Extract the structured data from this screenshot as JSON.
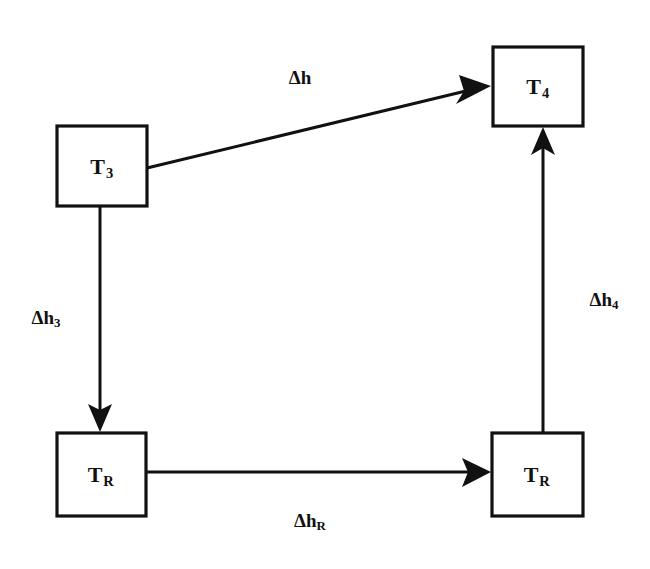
{
  "diagram": {
    "type": "block-flow-diagram",
    "title": "",
    "background_color": "#ffffff",
    "line_color": "#111111",
    "nodes": [
      {
        "id": "T3",
        "base": "T",
        "subscript": "3",
        "label": "T3",
        "x": 57,
        "y": 126,
        "width": 90,
        "height": 80,
        "center_x": 102,
        "center_y": 166
      },
      {
        "id": "T4",
        "base": "T",
        "subscript": "4",
        "label": "T4",
        "x": 493,
        "y": 47,
        "width": 90,
        "height": 79,
        "center_x": 538,
        "center_y": 86
      },
      {
        "id": "TR_left",
        "base": "T",
        "subscript": "R",
        "label": "TR",
        "x": 57,
        "y": 433,
        "width": 89,
        "height": 83,
        "center_x": 101,
        "center_y": 474
      },
      {
        "id": "TR_right",
        "base": "T",
        "subscript": "R",
        "label": "TR",
        "x": 492,
        "y": 433,
        "width": 91,
        "height": 83,
        "center_x": 537,
        "center_y": 474
      }
    ],
    "edges": [
      {
        "id": "edge-dh",
        "from": "T3",
        "to": "T4",
        "direction": "diagonal-up-right",
        "label_base": "Δh",
        "label_subscript": "",
        "label": "Δh",
        "label_x": 300,
        "label_y": 78,
        "x1": 147,
        "y1": 168,
        "x2": 489,
        "y2": 86
      },
      {
        "id": "edge-dh3",
        "from": "T3",
        "to": "TR_left",
        "direction": "down",
        "label_base": "Δh",
        "label_subscript": "3",
        "label": "Δh3",
        "label_x": 46,
        "label_y": 318,
        "x1": 100,
        "y1": 206,
        "x2": 100,
        "y2": 430
      },
      {
        "id": "edge-dhR",
        "from": "TR_left",
        "to": "TR_right",
        "direction": "right",
        "label_base": "Δh",
        "label_subscript": "R",
        "label": "ΔhR",
        "label_x": 310,
        "label_y": 521,
        "x1": 146,
        "y1": 472,
        "x2": 489,
        "y2": 472
      },
      {
        "id": "edge-dh4",
        "from": "TR_right",
        "to": "T4",
        "direction": "up",
        "label_base": "Δh",
        "label_subscript": "4",
        "label": "Δh4",
        "label_x": 604,
        "label_y": 300,
        "x1": 543,
        "y1": 432,
        "x2": 543,
        "y2": 130
      }
    ]
  }
}
